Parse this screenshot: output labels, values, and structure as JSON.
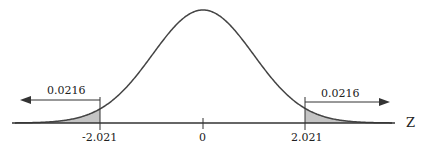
{
  "chart_data": {
    "type": "area",
    "title": "",
    "xlabel": "Z",
    "ylabel": "",
    "tick_labels": [
      "-2.021",
      "0",
      "2.021"
    ],
    "ticks": [
      -2.021,
      0,
      2.021
    ],
    "shaded_regions": [
      {
        "name": "left-tail",
        "from": "-inf",
        "to": -2.021,
        "area": 0.0216,
        "label": "0.0216",
        "arrow": "left"
      },
      {
        "name": "right-tail",
        "from": 2.021,
        "to": "inf",
        "area": 0.0216,
        "label": "0.0216",
        "arrow": "right"
      }
    ],
    "xlim": [
      -4,
      4
    ],
    "grid": false,
    "legend": null
  },
  "labels": {
    "axis": "Z",
    "left_tick": "-2.021",
    "center_tick": "0",
    "right_tick": "2.021",
    "left_area": "0.0216",
    "right_area": "0.0216"
  },
  "colors": {
    "curve": "#444444",
    "shade": "#bdbdbd",
    "axis": "#333333"
  }
}
